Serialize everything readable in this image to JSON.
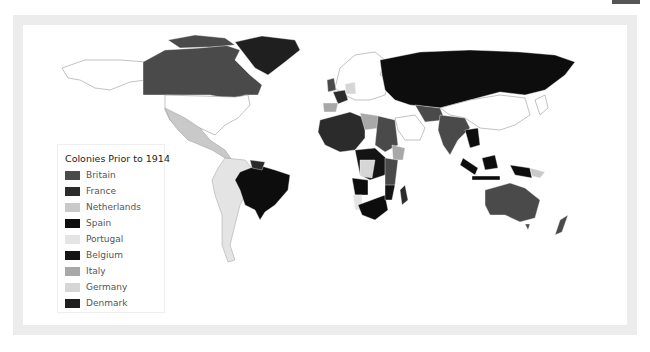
{
  "map": {
    "type": "choropleth",
    "subject": "World map of colonies prior to 1914"
  },
  "legend": {
    "title": "Colonies Prior to 1914",
    "items": [
      {
        "label": "Britain",
        "color": "#4a4a4a"
      },
      {
        "label": "France",
        "color": "#2b2b2b"
      },
      {
        "label": "Netherlands",
        "color": "#c9c9c9"
      },
      {
        "label": "Spain",
        "color": "#0d0d0d"
      },
      {
        "label": "Portugal",
        "color": "#e4e4e4"
      },
      {
        "label": "Belgium",
        "color": "#141414"
      },
      {
        "label": "Italy",
        "color": "#a8a8a8"
      },
      {
        "label": "Germany",
        "color": "#d6d6d6"
      },
      {
        "label": "Denmark",
        "color": "#1f1f1f"
      }
    ]
  },
  "colors": {
    "frame": "#ececec",
    "background": "#ffffff",
    "uncolonized_border": "#9a9a9a"
  }
}
